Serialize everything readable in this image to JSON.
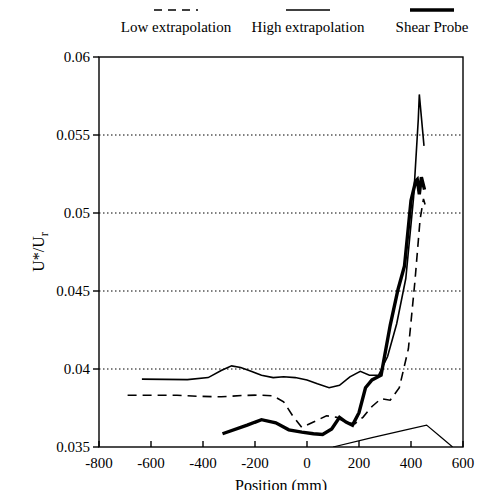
{
  "legend": {
    "items": [
      {
        "label": "Low extrapolation",
        "style": "dashed",
        "width": 1.6,
        "x": 176,
        "key_width": 46
      },
      {
        "label": "High extrapolation",
        "style": "solid",
        "width": 1.6,
        "x": 308,
        "key_width": 46
      },
      {
        "label": "Shear Probe",
        "style": "solid",
        "width": 3.4,
        "x": 432,
        "key_width": 46
      }
    ]
  },
  "chart_data": {
    "type": "line",
    "title": "",
    "xlabel": "Position (mm)",
    "ylabel": "U*/Ur",
    "ylabel_parts": {
      "main": "U*/U",
      "subscript": "r"
    },
    "xlim": [
      -800,
      600
    ],
    "ylim": [
      0.035,
      0.06
    ],
    "xticks": [
      -800,
      -600,
      -400,
      -200,
      0,
      200,
      400,
      600
    ],
    "xtick_labels": [
      "-800",
      "-600",
      "-400",
      "-200",
      "0",
      "200",
      "400",
      "600"
    ],
    "yticks": [
      0.035,
      0.04,
      0.045,
      0.05,
      0.055,
      0.06
    ],
    "ytick_labels": [
      "0.035",
      "0.04",
      "0.045",
      "0.05",
      "0.055",
      "0.06"
    ],
    "grid": "horizontal-dotted",
    "grid_values": [
      0.04,
      0.045,
      0.05,
      0.055
    ],
    "legend_position": "above-plot",
    "series": [
      {
        "name": "Low extrapolation",
        "style": "dashed",
        "width": 1.6,
        "points": [
          [
            -690,
            0.03832
          ],
          [
            -500,
            0.03832
          ],
          [
            -420,
            0.03825
          ],
          [
            -330,
            0.03822
          ],
          [
            -250,
            0.0383
          ],
          [
            -180,
            0.03833
          ],
          [
            -130,
            0.03828
          ],
          [
            -90,
            0.0379
          ],
          [
            -55,
            0.037
          ],
          [
            -20,
            0.03625
          ],
          [
            25,
            0.0366
          ],
          [
            75,
            0.037
          ],
          [
            115,
            0.0369
          ],
          [
            150,
            0.03655
          ],
          [
            185,
            0.0365
          ],
          [
            215,
            0.0369
          ],
          [
            250,
            0.0376
          ],
          [
            285,
            0.0381
          ],
          [
            320,
            0.038
          ],
          [
            355,
            0.0388
          ],
          [
            390,
            0.0413
          ],
          [
            415,
            0.0456
          ],
          [
            435,
            0.0496
          ],
          [
            448,
            0.0509
          ],
          [
            455,
            0.0505
          ]
        ]
      },
      {
        "name": "High extrapolation",
        "style": "solid",
        "width": 1.6,
        "points": [
          [
            -635,
            0.03935
          ],
          [
            -460,
            0.03932
          ],
          [
            -380,
            0.03945
          ],
          [
            -330,
            0.0399
          ],
          [
            -290,
            0.0402
          ],
          [
            -255,
            0.0401
          ],
          [
            -215,
            0.03985
          ],
          [
            -175,
            0.0396
          ],
          [
            -130,
            0.03945
          ],
          [
            -90,
            0.0395
          ],
          [
            -45,
            0.03945
          ],
          [
            0,
            0.0393
          ],
          [
            40,
            0.03905
          ],
          [
            85,
            0.0388
          ],
          [
            125,
            0.03895
          ],
          [
            165,
            0.0395
          ],
          [
            205,
            0.03985
          ],
          [
            240,
            0.0396
          ],
          [
            275,
            0.0396
          ],
          [
            310,
            0.0408
          ],
          [
            345,
            0.0429
          ],
          [
            380,
            0.0458
          ],
          [
            410,
            0.051
          ],
          [
            428,
            0.056
          ],
          [
            432,
            0.0576
          ],
          [
            450,
            0.0543
          ]
        ]
      },
      {
        "name": "Shear Probe",
        "style": "solid",
        "width": 3.4,
        "points": [
          [
            -325,
            0.03585
          ],
          [
            -230,
            0.0364
          ],
          [
            -175,
            0.03675
          ],
          [
            -120,
            0.03655
          ],
          [
            -70,
            0.0361
          ],
          [
            -20,
            0.03595
          ],
          [
            25,
            0.03585
          ],
          [
            60,
            0.0358
          ],
          [
            95,
            0.03615
          ],
          [
            125,
            0.0369
          ],
          [
            150,
            0.0366
          ],
          [
            175,
            0.0364
          ],
          [
            200,
            0.0372
          ],
          [
            225,
            0.0388
          ],
          [
            250,
            0.0393
          ],
          [
            285,
            0.0396
          ],
          [
            320,
            0.0428
          ],
          [
            350,
            0.0451
          ],
          [
            375,
            0.0466
          ],
          [
            400,
            0.0508
          ],
          [
            418,
            0.05205
          ],
          [
            424,
            0.05215
          ],
          [
            432,
            0.0512
          ],
          [
            440,
            0.0523
          ],
          [
            452,
            0.0515
          ]
        ]
      },
      {
        "name": "baseline-thin",
        "style": "solid",
        "width": 1.2,
        "points": [
          [
            100,
            0.035
          ],
          [
            250,
            0.0356
          ],
          [
            380,
            0.0361
          ],
          [
            460,
            0.0364
          ],
          [
            510,
            0.0357
          ],
          [
            560,
            0.035
          ]
        ]
      }
    ]
  }
}
